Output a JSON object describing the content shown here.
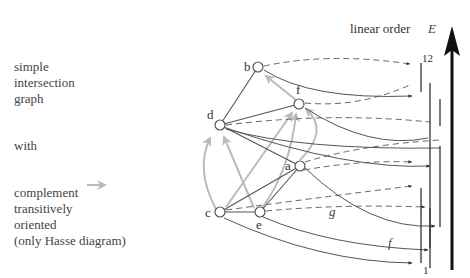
{
  "left_text": {
    "block1": [
      "simple",
      "intersection",
      "graph"
    ],
    "block2": "with",
    "block3": [
      "complement",
      "transitively",
      "oriented",
      "(only Hasse diagram)"
    ]
  },
  "axis": {
    "label": "linear order",
    "symbol": "E",
    "top_tick": "12",
    "bottom_tick": "1"
  },
  "nodes": [
    {
      "id": "b",
      "label": "b",
      "x": 258,
      "y": 67
    },
    {
      "id": "f",
      "label": "f",
      "x": 299,
      "y": 104
    },
    {
      "id": "d",
      "label": "d",
      "x": 220,
      "y": 125
    },
    {
      "id": "a",
      "label": "a",
      "x": 300,
      "y": 166
    },
    {
      "id": "c",
      "label": "c",
      "x": 220,
      "y": 212
    },
    {
      "id": "e",
      "label": "e",
      "x": 260,
      "y": 212
    }
  ],
  "edge_labels": {
    "g": "g",
    "f": "f"
  },
  "colors": {
    "graph": "#555555",
    "complement": "#bbbbbb",
    "axis": "#111111"
  }
}
